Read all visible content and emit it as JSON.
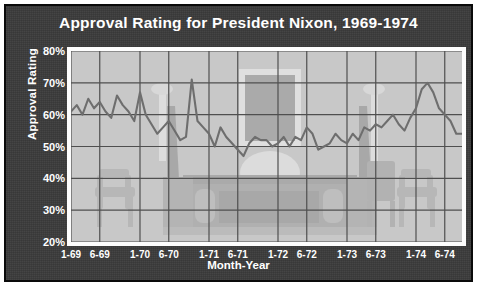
{
  "title": "Approval Rating for President Nixon, 1969-1974",
  "axes": {
    "ylabel": "Approval Rating",
    "xlabel": "Month-Year"
  },
  "colors": {
    "background": "#3b3b3b",
    "plot_area": "#c8c8c8",
    "line": "#6e6e6e",
    "grid": "#4f4f4f",
    "text": "#ffffff",
    "border": "#0a0a0a"
  },
  "chart_data": {
    "type": "line",
    "title": "Approval Rating for President Nixon, 1969-1974",
    "xlabel": "Month-Year",
    "ylabel": "Approval Rating",
    "ylim": [
      20,
      80
    ],
    "ytick_labels": [
      "80%",
      "70%",
      "60%",
      "50%",
      "40%",
      "30%",
      "20%"
    ],
    "ytick_values": [
      80,
      70,
      60,
      50,
      40,
      30,
      20
    ],
    "xtick_labels": [
      "1-69",
      "6-69",
      "1-70",
      "6-70",
      "1-71",
      "6-71",
      "1-72",
      "6-72",
      "1-73",
      "6-73",
      "1-74",
      "6-74"
    ],
    "xtick_values": [
      0,
      5,
      12,
      17,
      24,
      29,
      36,
      41,
      48,
      53,
      60,
      65
    ],
    "grid": true,
    "legend": "none",
    "xlim": [
      0,
      68
    ],
    "series": [
      {
        "name": "Approval Rating",
        "x": [
          0,
          1,
          2,
          3,
          4,
          5,
          6,
          7,
          8,
          9,
          10,
          11,
          12,
          13,
          14,
          15,
          16,
          17,
          18,
          19,
          20,
          21,
          22,
          23,
          24,
          25,
          26,
          27,
          28,
          29,
          30,
          31,
          32,
          33,
          34,
          35,
          36,
          37,
          38,
          39,
          40,
          41,
          42,
          43,
          44,
          45,
          46,
          47,
          48,
          49,
          50,
          51,
          52,
          53,
          54,
          55,
          56,
          57,
          58,
          59,
          60,
          61,
          62,
          63,
          64,
          65,
          66,
          67,
          68
        ],
        "values": [
          61,
          63,
          60,
          65,
          62,
          64,
          61,
          59,
          66,
          63,
          61,
          58,
          67,
          60,
          57,
          54,
          56,
          58,
          55,
          52,
          53,
          71,
          58,
          56,
          54,
          50,
          56,
          53,
          51,
          49,
          47,
          51,
          53,
          52,
          52,
          50,
          51,
          53,
          50,
          53,
          52,
          56,
          54,
          49,
          50,
          51,
          54,
          52,
          51,
          54,
          52,
          56,
          55,
          57,
          56,
          58,
          60,
          57,
          55,
          59,
          62,
          68,
          70,
          67,
          62,
          60,
          58,
          54,
          54
        ],
        "note": "values read from gridlines, percent approval"
      }
    ],
    "annotations": [
      {
        "text": "Background watermark image of the Oval Office (desk, mantel, chairs, lamps)"
      }
    ]
  },
  "watermark": {
    "name": "oval-office-watermark",
    "description": "Oval Office interior silhouette: desk, mantel/fireplace, armchairs, table lamps"
  }
}
